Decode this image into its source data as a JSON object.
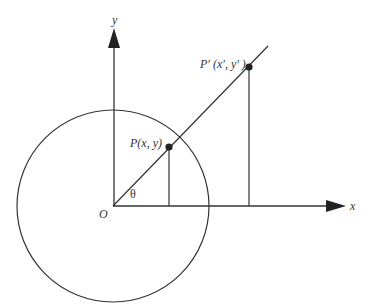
{
  "diagram": {
    "type": "geometry",
    "colors": {
      "stroke": "#333333",
      "background": "#ffffff"
    },
    "labels": {
      "y_axis": "y",
      "x_axis": "x",
      "origin": "O",
      "angle": "θ",
      "point_p": "P(x, y)",
      "point_p_prime": "P′ (x′, y′ )"
    },
    "elements": [
      {
        "id": "x-axis",
        "kind": "arrow",
        "label": "x"
      },
      {
        "id": "y-axis",
        "kind": "arrow",
        "label": "y"
      },
      {
        "id": "circle",
        "kind": "circle",
        "center": "O"
      },
      {
        "id": "ray",
        "kind": "line",
        "from": "O",
        "through": [
          "P",
          "P′"
        ]
      },
      {
        "id": "drop-p",
        "kind": "line",
        "from": "P",
        "to": "x-axis"
      },
      {
        "id": "drop-p-prime",
        "kind": "line",
        "from": "P′",
        "to": "x-axis"
      },
      {
        "id": "P",
        "kind": "point",
        "label": "P(x, y)"
      },
      {
        "id": "P-prime",
        "kind": "point",
        "label": "P′ (x′, y′ )"
      }
    ]
  }
}
